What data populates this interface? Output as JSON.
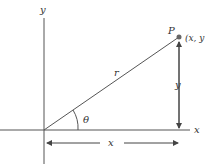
{
  "diagram": {
    "axes": {
      "x_label": "x",
      "y_label": "y"
    },
    "point": {
      "name": "P",
      "coords": "(x, y"
    },
    "segment_label": "r",
    "angle_label": "θ",
    "vertical_dimension_label": "y",
    "horizontal_dimension_label": "x",
    "colors": {
      "line": "#555555",
      "point": "#666666",
      "text": "#333333"
    }
  }
}
